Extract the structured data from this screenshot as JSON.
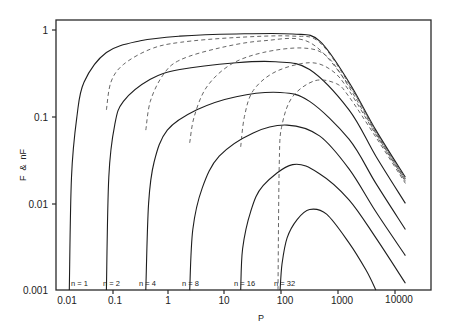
{
  "chart_data": {
    "type": "line",
    "title": "",
    "xlabel": "P",
    "ylabel": "F  &  nF",
    "xscale": "log",
    "yscale": "log",
    "xlim": [
      0.008,
      30000
    ],
    "ylim": [
      0.001,
      1.3
    ],
    "grid": false,
    "legend": "none (curves labeled inline at base)",
    "x_ticks": [
      "0.01",
      "0.1",
      "1",
      "10",
      "100",
      "1000",
      "10000"
    ],
    "y_ticks": [
      "1",
      "0.1",
      "0.01",
      "0.001"
    ],
    "annotations": [
      "n = 1",
      "n = 2",
      "n = 4",
      "n = 8",
      "n = 16",
      "n = 32"
    ],
    "series": [
      {
        "name": "nF, n=1",
        "style": "solid",
        "threshold_P": 0.011,
        "peak_value": 0.92,
        "peak_P": 30,
        "value_at_10000": 0.02,
        "points": [
          [
            0.011,
            0.001
          ],
          [
            0.012,
            0.02
          ],
          [
            0.015,
            0.1
          ],
          [
            0.02,
            0.25
          ],
          [
            0.05,
            0.55
          ],
          [
            0.2,
            0.75
          ],
          [
            1,
            0.85
          ],
          [
            10,
            0.9
          ],
          [
            100,
            0.9
          ],
          [
            300,
            0.75
          ],
          [
            1000,
            0.25
          ],
          [
            3000,
            0.07
          ],
          [
            10000,
            0.02
          ]
        ]
      },
      {
        "name": "nF, n=2",
        "style": "solid",
        "threshold_P": 0.05,
        "peak_value": 0.43,
        "peak_P": 50,
        "value_at_10000": 0.01,
        "points": [
          [
            0.05,
            0.001
          ],
          [
            0.055,
            0.02
          ],
          [
            0.07,
            0.08
          ],
          [
            0.1,
            0.15
          ],
          [
            0.3,
            0.27
          ],
          [
            1,
            0.35
          ],
          [
            10,
            0.42
          ],
          [
            50,
            0.43
          ],
          [
            200,
            0.35
          ],
          [
            1000,
            0.12
          ],
          [
            3000,
            0.035
          ],
          [
            10000,
            0.01
          ]
        ]
      },
      {
        "name": "nF, n=4",
        "style": "solid",
        "threshold_P": 0.25,
        "peak_value": 0.19,
        "peak_P": 60,
        "value_at_10000": 0.005,
        "points": [
          [
            0.25,
            0.001
          ],
          [
            0.28,
            0.01
          ],
          [
            0.35,
            0.03
          ],
          [
            0.6,
            0.07
          ],
          [
            2,
            0.12
          ],
          [
            10,
            0.17
          ],
          [
            60,
            0.19
          ],
          [
            200,
            0.15
          ],
          [
            1000,
            0.055
          ],
          [
            3000,
            0.017
          ],
          [
            10000,
            0.005
          ]
        ]
      },
      {
        "name": "nF, n=8",
        "style": "solid",
        "threshold_P": 1.5,
        "peak_value": 0.08,
        "peak_P": 80,
        "value_at_10000": 0.0025,
        "points": [
          [
            1.5,
            0.001
          ],
          [
            1.7,
            0.005
          ],
          [
            2.5,
            0.015
          ],
          [
            5,
            0.035
          ],
          [
            20,
            0.065
          ],
          [
            80,
            0.08
          ],
          [
            300,
            0.06
          ],
          [
            1000,
            0.025
          ],
          [
            3000,
            0.008
          ],
          [
            10000,
            0.0025
          ]
        ]
      },
      {
        "name": "nF, n=16",
        "style": "solid",
        "threshold_P": 12,
        "peak_value": 0.028,
        "peak_P": 100,
        "value_at_10000": 0.0012,
        "points": [
          [
            12,
            0.001
          ],
          [
            13,
            0.003
          ],
          [
            18,
            0.008
          ],
          [
            30,
            0.016
          ],
          [
            100,
            0.028
          ],
          [
            300,
            0.022
          ],
          [
            1000,
            0.011
          ],
          [
            3000,
            0.004
          ],
          [
            10000,
            0.0012
          ]
        ]
      },
      {
        "name": "nF, n=32",
        "style": "solid",
        "threshold_P": 60,
        "peak_value": 0.0085,
        "peak_P": 200,
        "value_at_axis_P": 3000,
        "points": [
          [
            60,
            0.001
          ],
          [
            65,
            0.002
          ],
          [
            80,
            0.004
          ],
          [
            120,
            0.0065
          ],
          [
            200,
            0.0085
          ],
          [
            400,
            0.0075
          ],
          [
            1000,
            0.0035
          ],
          [
            2000,
            0.0017
          ],
          [
            3000,
            0.001
          ]
        ]
      },
      {
        "name": "F, n=2",
        "style": "dashed",
        "threshold_P": 0.05,
        "points": [
          [
            0.05,
            0.12
          ],
          [
            0.06,
            0.25
          ],
          [
            0.1,
            0.4
          ],
          [
            0.3,
            0.6
          ],
          [
            1,
            0.72
          ],
          [
            10,
            0.82
          ],
          [
            100,
            0.85
          ],
          [
            300,
            0.72
          ],
          [
            1000,
            0.24
          ],
          [
            3000,
            0.068
          ],
          [
            10000,
            0.019
          ]
        ]
      },
      {
        "name": "F, n=4",
        "style": "dashed",
        "threshold_P": 0.25,
        "points": [
          [
            0.25,
            0.07
          ],
          [
            0.3,
            0.15
          ],
          [
            0.5,
            0.3
          ],
          [
            1,
            0.45
          ],
          [
            5,
            0.62
          ],
          [
            30,
            0.75
          ],
          [
            200,
            0.72
          ],
          [
            1000,
            0.23
          ],
          [
            3000,
            0.066
          ],
          [
            10000,
            0.019
          ]
        ]
      },
      {
        "name": "F, n=8",
        "style": "dashed",
        "threshold_P": 1.5,
        "points": [
          [
            1.5,
            0.05
          ],
          [
            1.8,
            0.1
          ],
          [
            3,
            0.22
          ],
          [
            8,
            0.4
          ],
          [
            30,
            0.55
          ],
          [
            150,
            0.62
          ],
          [
            400,
            0.5
          ],
          [
            1000,
            0.22
          ],
          [
            3000,
            0.064
          ],
          [
            10000,
            0.018
          ]
        ]
      },
      {
        "name": "F, n=16",
        "style": "dashed",
        "threshold_P": 12,
        "points": [
          [
            12,
            0.045
          ],
          [
            14,
            0.1
          ],
          [
            20,
            0.2
          ],
          [
            50,
            0.33
          ],
          [
            200,
            0.42
          ],
          [
            500,
            0.34
          ],
          [
            1000,
            0.2
          ],
          [
            3000,
            0.062
          ],
          [
            10000,
            0.018
          ]
        ]
      },
      {
        "name": "F, n=32",
        "style": "dashed",
        "threshold_P": 60,
        "points": [
          [
            55,
            0.001
          ],
          [
            58,
            0.03
          ],
          [
            65,
            0.08
          ],
          [
            100,
            0.17
          ],
          [
            250,
            0.26
          ],
          [
            600,
            0.24
          ],
          [
            1000,
            0.17
          ],
          [
            3000,
            0.058
          ],
          [
            10000,
            0.017
          ]
        ]
      }
    ]
  },
  "axes": {
    "x_label": "P",
    "y_label": "F  &  nF",
    "x_tick_labels": [
      "0.01",
      "0.1",
      "1",
      "10",
      "100",
      "1000",
      "10000"
    ],
    "y_tick_labels": [
      "1",
      "0.1",
      "0.01",
      "0.001"
    ]
  },
  "labels": {
    "n1": "n = 1",
    "n2": "n = 2",
    "n4": "n = 4",
    "n8": "n = 8",
    "n16": "n = 16",
    "n32": "n = 32"
  }
}
